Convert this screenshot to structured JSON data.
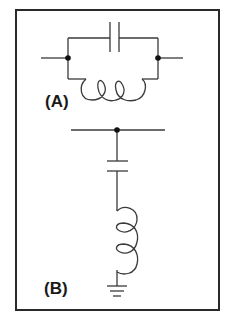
{
  "figure": {
    "frame_color": "#2a2a2a",
    "wire_color": "#3a3a3a",
    "background": "#ffffff"
  },
  "circuits": [
    {
      "label": "(A)",
      "description": "Parallel LC circuit: capacitor in parallel with inductor between two nodes",
      "components": [
        "capacitor",
        "inductor"
      ],
      "connection": "parallel"
    },
    {
      "label": "(B)",
      "description": "Series LC circuit from a line node to ground: capacitor in series with inductor, then ground",
      "components": [
        "capacitor",
        "inductor",
        "ground"
      ],
      "connection": "series-to-ground"
    }
  ]
}
